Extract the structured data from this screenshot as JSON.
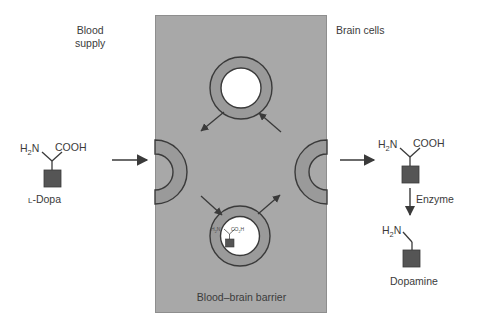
{
  "diagram": {
    "labels": {
      "blood_supply_line1": "Blood",
      "blood_supply_line2": "supply",
      "brain_cells": "Brain cells",
      "blood_brain_barrier": "Blood–brain barrier"
    },
    "left_molecule": {
      "caption": "L-Dopa",
      "amine_group": "H",
      "amine_sub": "2",
      "amine_tail": "N",
      "acid_group": "COOH"
    },
    "right_molecule": {
      "caption": "",
      "amine_group": "H",
      "amine_sub": "2",
      "amine_tail": "N",
      "acid_group": "COOH"
    },
    "enzyme_step": {
      "label": "Enzyme"
    },
    "product_molecule": {
      "caption": "Dopamine",
      "amine_group": "H",
      "amine_sub": "2",
      "amine_tail": "N"
    },
    "carrier_bound_molecule": {
      "amine_group": "H",
      "amine_sub": "2",
      "amine_tail": "N",
      "acid_group": "CO",
      "acid_sub": "2",
      "acid_tail": "H"
    },
    "transporters": [
      {
        "name": "left-pocket-transporter",
        "state": "open-to-blood"
      },
      {
        "name": "right-pocket-transporter",
        "state": "open-to-brain"
      },
      {
        "name": "top-empty-carrier",
        "state": "empty"
      },
      {
        "name": "bottom-loaded-carrier",
        "state": "loaded-with-l-dopa"
      }
    ],
    "colors": {
      "barrier_fill": "#a8a8a8",
      "barrier_stroke": "#8e8e8e",
      "carrier_fill": "#9a9a9a",
      "carrier_stroke": "#3a3a3a",
      "cavity_fill": "#ffffff",
      "molecule_square": "#555555",
      "bond_stroke": "#3a3a3a",
      "text": "#3b3b3b"
    }
  }
}
